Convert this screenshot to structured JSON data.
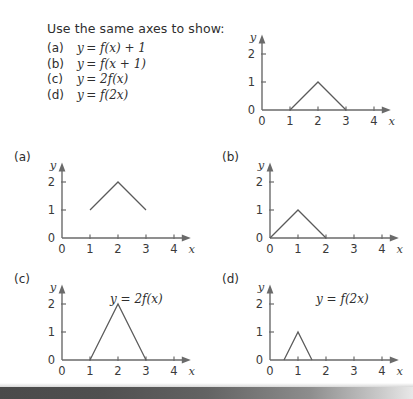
{
  "prompt": {
    "title": "Use the same axes to show:",
    "items": [
      {
        "tag": "(a)",
        "lhs": "y",
        "eq": "= f(x) + 1"
      },
      {
        "tag": "(b)",
        "lhs": "y",
        "eq": "= f(x + 1)"
      },
      {
        "tag": "(c)",
        "lhs": "y",
        "eq": "= 2f(x)"
      },
      {
        "tag": "(d)",
        "lhs": "y",
        "eq": "= f(2x)"
      }
    ]
  },
  "axis": {
    "x_label": "x",
    "y_label": "y",
    "x_ticks": [
      "0",
      "1",
      "2",
      "3",
      "4"
    ],
    "y_ticks": [
      "0",
      "1",
      "2"
    ]
  },
  "chart_data": [
    {
      "type": "line",
      "name": "reference",
      "title": "",
      "panel_label": "",
      "inline_label": "",
      "xlabel": "x",
      "ylabel": "y",
      "xlim": [
        0,
        4.6
      ],
      "ylim": [
        0,
        2.7
      ],
      "xticks": [
        0,
        1,
        2,
        3,
        4
      ],
      "yticks": [
        0,
        1,
        2
      ],
      "xticklabels": [
        "0",
        "1",
        "2",
        "3",
        "4"
      ],
      "yticklabels": [
        "0",
        "1",
        "2"
      ],
      "grid": false,
      "legend": "none",
      "x": [
        1,
        2,
        3
      ],
      "y": [
        0,
        1,
        0
      ]
    },
    {
      "type": "line",
      "name": "a",
      "title": "",
      "panel_label": "(a)",
      "inline_label": "",
      "xlabel": "x",
      "ylabel": "y",
      "xlim": [
        0,
        4.6
      ],
      "ylim": [
        0,
        2.7
      ],
      "xticks": [
        0,
        1,
        2,
        3,
        4
      ],
      "yticks": [
        0,
        1,
        2
      ],
      "xticklabels": [
        "0",
        "1",
        "2",
        "3",
        "4"
      ],
      "yticklabels": [
        "0",
        "1",
        "2"
      ],
      "grid": false,
      "legend": "none",
      "x": [
        1,
        2,
        3
      ],
      "y": [
        1,
        2,
        1
      ]
    },
    {
      "type": "line",
      "name": "b",
      "title": "",
      "panel_label": "(b)",
      "inline_label": "",
      "xlabel": "x",
      "ylabel": "y",
      "xlim": [
        0,
        4.6
      ],
      "ylim": [
        0,
        2.7
      ],
      "xticks": [
        0,
        1,
        2,
        3,
        4
      ],
      "yticks": [
        0,
        1,
        2
      ],
      "xticklabels": [
        "0",
        "1",
        "2",
        "3",
        "4"
      ],
      "yticklabels": [
        "0",
        "1",
        "2"
      ],
      "grid": false,
      "legend": "none",
      "x": [
        0,
        1,
        2
      ],
      "y": [
        0,
        1,
        0
      ]
    },
    {
      "type": "line",
      "name": "c",
      "title": "",
      "panel_label": "(c)",
      "inline_label": "y = 2f(x)",
      "xlabel": "x",
      "ylabel": "y",
      "xlim": [
        0,
        4.6
      ],
      "ylim": [
        0,
        2.7
      ],
      "xticks": [
        0,
        1,
        2,
        3,
        4
      ],
      "yticks": [
        0,
        1,
        2
      ],
      "xticklabels": [
        "0",
        "1",
        "2",
        "3",
        "4"
      ],
      "yticklabels": [
        "0",
        "1",
        "2"
      ],
      "grid": false,
      "legend": "none",
      "x": [
        1,
        2,
        3
      ],
      "y": [
        0,
        2,
        0
      ]
    },
    {
      "type": "line",
      "name": "d",
      "title": "",
      "panel_label": "(d)",
      "inline_label": "y = f(2x)",
      "xlabel": "x",
      "ylabel": "y",
      "xlim": [
        0,
        4.6
      ],
      "ylim": [
        0,
        2.7
      ],
      "xticks": [
        0,
        1,
        2,
        3,
        4
      ],
      "yticks": [
        0,
        1,
        2
      ],
      "xticklabels": [
        "0",
        "1",
        "2",
        "3",
        "4"
      ],
      "yticklabels": [
        "0",
        "1",
        "2"
      ],
      "grid": false,
      "legend": "none",
      "x": [
        0.5,
        1,
        1.5
      ],
      "y": [
        0,
        1,
        0
      ]
    }
  ],
  "colors": {
    "ink": "#3a3a3a",
    "curve": "#5a5a5a",
    "axis": "#6a6a6a",
    "band_dark": "#4a4a4a",
    "band_light": "#e8e8e8"
  }
}
